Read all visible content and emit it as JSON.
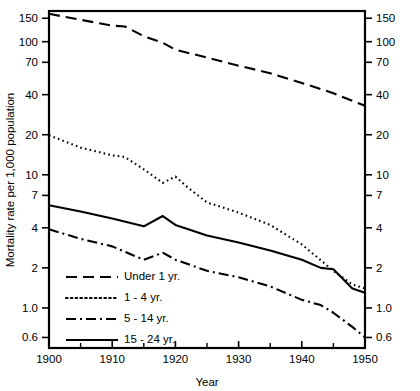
{
  "chart_data": {
    "type": "line",
    "title": "",
    "xlabel": "Year",
    "ylabel": "Mortality rate per 1,000 population",
    "xlim": [
      1900,
      1950
    ],
    "ylim": [
      0.5,
      170
    ],
    "yscale": "log",
    "grid": false,
    "legend_position": "bottom-left",
    "x_ticks": [
      1900,
      1910,
      1920,
      1930,
      1940,
      1950
    ],
    "x_ticks_minor": [
      1905,
      1915,
      1925,
      1935,
      1945
    ],
    "y_ticks": [
      150,
      100,
      70,
      40,
      20,
      10,
      7,
      4,
      2,
      1.0,
      0.6
    ],
    "y_tick_labels": [
      "150",
      "100",
      "70",
      "40",
      "20",
      "10",
      "7",
      "4",
      "2",
      "1.0",
      "0.6"
    ],
    "axes": [
      "left",
      "right",
      "top",
      "bottom"
    ],
    "series": [
      {
        "name": "Under 1 yr.",
        "style": "dashed",
        "x": [
          1900,
          1905,
          1910,
          1912,
          1915,
          1918,
          1920,
          1925,
          1930,
          1935,
          1940,
          1945,
          1948,
          1950
        ],
        "values": [
          162,
          146,
          132,
          130,
          110,
          98,
          87,
          76,
          66,
          58,
          49,
          41,
          36,
          33
        ]
      },
      {
        "name": "1 - 4 yr.",
        "style": "dotted",
        "x": [
          1900,
          1905,
          1910,
          1912,
          1915,
          1918,
          1920,
          1922,
          1925,
          1930,
          1935,
          1940,
          1945,
          1948,
          1950
        ],
        "values": [
          19.8,
          16.0,
          14.0,
          13.6,
          11.0,
          8.7,
          9.7,
          8.0,
          6.2,
          5.2,
          4.2,
          3.0,
          1.9,
          1.5,
          1.4
        ]
      },
      {
        "name": "5 - 14 yr.",
        "style": "dashdot",
        "x": [
          1900,
          1905,
          1910,
          1915,
          1918,
          1920,
          1925,
          1930,
          1935,
          1940,
          1943,
          1945,
          1948,
          1950
        ],
        "values": [
          3.9,
          3.3,
          2.9,
          2.3,
          2.6,
          2.3,
          1.9,
          1.7,
          1.45,
          1.15,
          1.05,
          0.92,
          0.72,
          0.6
        ]
      },
      {
        "name": "15 - 24 yr.",
        "style": "solid",
        "x": [
          1900,
          1905,
          1910,
          1915,
          1918,
          1920,
          1925,
          1930,
          1935,
          1940,
          1943,
          1945,
          1948,
          1950
        ],
        "values": [
          5.9,
          5.3,
          4.7,
          4.1,
          4.9,
          4.2,
          3.5,
          3.1,
          2.7,
          2.3,
          2.0,
          1.95,
          1.4,
          1.3
        ]
      }
    ]
  },
  "legend": {
    "items": [
      {
        "label": "Under 1 yr.",
        "style": "dashed"
      },
      {
        "label": "1 - 4 yr.",
        "style": "dotted"
      },
      {
        "label": "5 - 14 yr.",
        "style": "dashdot"
      },
      {
        "label": "15 - 24 yr.",
        "style": "solid"
      }
    ]
  }
}
